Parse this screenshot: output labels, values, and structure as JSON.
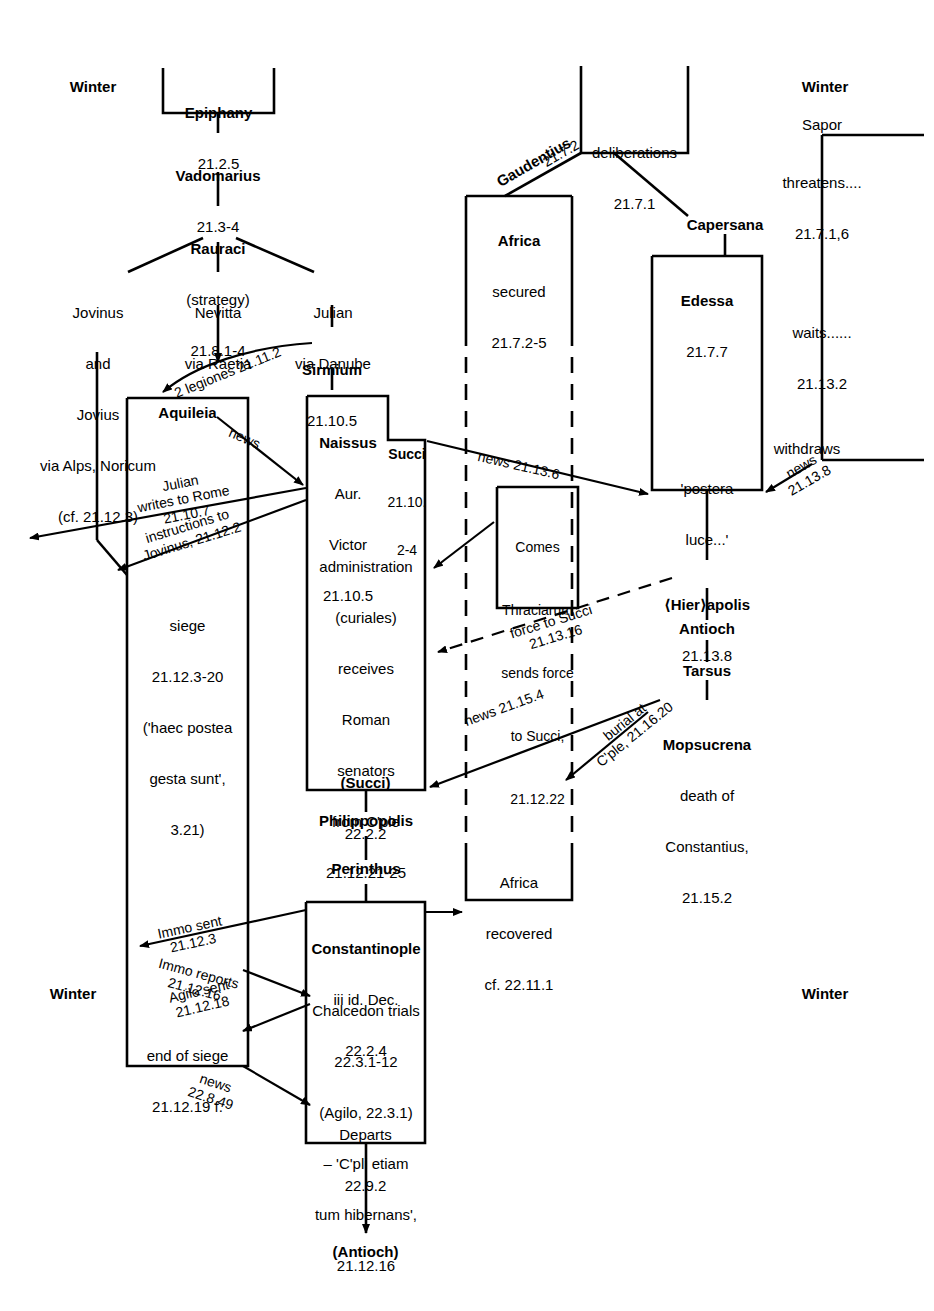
{
  "diagram": {
    "season_labels": [
      {
        "id": "winter-top-left",
        "text": "Winter"
      },
      {
        "id": "winter-top-right",
        "text": "Winter"
      },
      {
        "id": "winter-bottom-left",
        "text": "Winter"
      },
      {
        "id": "winter-bottom-right",
        "text": "Winter"
      }
    ],
    "nodes": [
      {
        "id": "epiphany",
        "lines": [
          "Epiphany",
          "21.2.5"
        ],
        "bold": [
          true,
          false
        ]
      },
      {
        "id": "vadomarius",
        "lines": [
          "Vadomarius",
          "21.3-4"
        ],
        "bold": [
          true,
          false
        ]
      },
      {
        "id": "rauraci",
        "lines": [
          "Rauraci",
          "(strategy)",
          "21.8.1-4"
        ],
        "bold": [
          true,
          false,
          false
        ]
      },
      {
        "id": "jovinus",
        "lines": [
          "Jovinus",
          "and",
          "Jovius",
          "via Alps, Noricum",
          "(cf. 21.12.3)"
        ],
        "bold": [
          false,
          false,
          false,
          false,
          false
        ]
      },
      {
        "id": "nevitta",
        "lines": [
          "Nevitta",
          "via Raetia"
        ],
        "bold": [
          false,
          false
        ]
      },
      {
        "id": "julian",
        "lines": [
          "Julian",
          "via Danube"
        ],
        "bold": [
          false,
          false
        ]
      },
      {
        "id": "sirmium",
        "lines": [
          "Sirmium",
          "21.10.5"
        ],
        "bold": [
          true,
          false
        ]
      },
      {
        "id": "aquileia",
        "lines": [
          "Aquileia"
        ],
        "bold": [
          true
        ]
      },
      {
        "id": "siege",
        "lines": [
          "siege",
          "21.12.3-20",
          "('haec postea",
          "gesta sunt',",
          "3.21)"
        ],
        "bold": [
          false,
          false,
          false,
          false,
          false
        ]
      },
      {
        "id": "end-of-siege",
        "lines": [
          "end of siege",
          "21.12.19 f."
        ],
        "bold": [
          false,
          false
        ]
      },
      {
        "id": "naissus",
        "lines": [
          "Naissus",
          "Aur.",
          "Victor",
          "21.10.5"
        ],
        "bold": [
          true,
          false,
          false,
          false
        ]
      },
      {
        "id": "succi",
        "lines": [
          "Succi",
          "21.10.",
          "2-4"
        ],
        "bold": [
          true,
          false,
          false
        ]
      },
      {
        "id": "administration",
        "lines": [
          "administration",
          "(curiales)",
          "receives",
          "Roman",
          "senators",
          "from C'ple",
          "21.12.21-25"
        ],
        "bold": [
          false,
          false,
          false,
          false,
          false,
          false,
          false
        ]
      },
      {
        "id": "succi-2",
        "lines": [
          "(Succi)",
          "22.2.2"
        ],
        "bold": [
          true,
          false
        ]
      },
      {
        "id": "philippopolis",
        "lines": [
          "Philippopolis"
        ],
        "bold": [
          true
        ]
      },
      {
        "id": "perinthus",
        "lines": [
          "Perinthus"
        ],
        "bold": [
          true
        ]
      },
      {
        "id": "constantinople",
        "lines": [
          "Constantinople",
          "iii id. Dec.",
          "22.2.4"
        ],
        "bold": [
          true,
          false,
          false
        ]
      },
      {
        "id": "chalcedon",
        "lines": [
          "Chalcedon trials",
          "22.3.1-12",
          "(Agilo, 22.3.1)",
          "– 'C'pli etiam",
          "tum hibernans',",
          "21.12.16"
        ],
        "bold": [
          false,
          false,
          false,
          false,
          false,
          false
        ]
      },
      {
        "id": "departs",
        "lines": [
          "Departs",
          "22.9.2"
        ],
        "bold": [
          false,
          false
        ]
      },
      {
        "id": "antioch-end",
        "lines": [
          "(Antioch)"
        ],
        "bold": [
          true
        ]
      },
      {
        "id": "deliberations",
        "lines": [
          "deliberations",
          "21.7.1"
        ],
        "bold": [
          false,
          false
        ]
      },
      {
        "id": "africa",
        "lines": [
          "Africa",
          "secured",
          "21.7.2-5"
        ],
        "bold": [
          true,
          false,
          false
        ]
      },
      {
        "id": "africa-recovered",
        "lines": [
          "Africa",
          "recovered",
          "cf. 22.11.1"
        ],
        "bold": [
          false,
          false,
          false
        ]
      },
      {
        "id": "capersana",
        "lines": [
          "Capersana"
        ],
        "bold": [
          true
        ]
      },
      {
        "id": "edessa",
        "lines": [
          "Edessa",
          "21.7.7"
        ],
        "bold": [
          true,
          false
        ]
      },
      {
        "id": "postera-luce",
        "lines": [
          "'postera",
          "luce...'"
        ],
        "bold": [
          false,
          false
        ]
      },
      {
        "id": "hierapolis",
        "lines": [
          "⟨Hier⟩apolis",
          "21.13.8"
        ],
        "bold": [
          true,
          false
        ]
      },
      {
        "id": "antioch",
        "lines": [
          "Antioch"
        ],
        "bold": [
          true
        ]
      },
      {
        "id": "tarsus",
        "lines": [
          "Tarsus"
        ],
        "bold": [
          true
        ]
      },
      {
        "id": "mopsucrena",
        "lines": [
          "Mopsucrena",
          "death of",
          "Constantius,",
          "21.15.2"
        ],
        "bold": [
          true,
          false,
          false,
          false
        ]
      },
      {
        "id": "comes-thraciarum",
        "lines": [
          "Comes",
          "Thraciarum",
          "sends force",
          "to Succi,",
          "21.12.22"
        ],
        "bold": [
          false,
          false,
          false,
          false,
          false
        ]
      },
      {
        "id": "sapor",
        "lines": [
          "Sapor"
        ],
        "bold": [
          false
        ]
      },
      {
        "id": "threatens",
        "lines": [
          "threatens....",
          "21.7.1,6"
        ],
        "bold": [
          false,
          false
        ]
      },
      {
        "id": "waits",
        "lines": [
          "waits......",
          "21.13.2"
        ],
        "bold": [
          false,
          false
        ]
      },
      {
        "id": "withdraws",
        "lines": [
          "withdraws"
        ],
        "bold": [
          false
        ]
      }
    ],
    "edge_labels": [
      {
        "id": "two-legiones",
        "text": "2 legiones 21.11.2"
      },
      {
        "id": "news-aquileia",
        "text": "news"
      },
      {
        "id": "julian-writes-rome",
        "text": "Julian\nwrites to Rome\n21.10.7"
      },
      {
        "id": "instructions-jovinus",
        "text": "instructions to\nJovinus, 21.12.2"
      },
      {
        "id": "gaudentius",
        "text": "Gaudentius"
      },
      {
        "id": "gaudentius-ref",
        "text": "21.7.2"
      },
      {
        "id": "news-21-13-6",
        "text": "news 21.13.6"
      },
      {
        "id": "news-21-13-8",
        "text": "news\n21.13.8"
      },
      {
        "id": "force-to-succi",
        "text": "force to Succi\n21.13.16"
      },
      {
        "id": "news-21-15-4",
        "text": "news 21.15.4"
      },
      {
        "id": "burial-cple",
        "text": "burial at\nC'ple, 21.16.20"
      },
      {
        "id": "immo-sent",
        "text": "Immo sent\n21.12.3"
      },
      {
        "id": "immo-reports",
        "text": "Immo reports\n21.12.16"
      },
      {
        "id": "agilo-sent",
        "text": "Agilo sent\n21.12.18"
      },
      {
        "id": "news-22-8-49",
        "text": "news\n22.8.49"
      }
    ],
    "colors": {
      "ink": "#000000",
      "background": "#ffffff"
    }
  }
}
